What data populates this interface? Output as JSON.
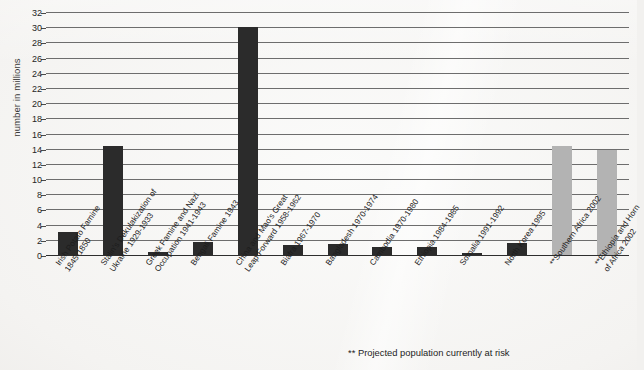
{
  "chart_data": {
    "type": "bar",
    "title": "",
    "xlabel": "",
    "ylabel": "number in millions",
    "ylim": [
      0,
      32
    ],
    "ytick_step": 2,
    "yticks": [
      0,
      2,
      4,
      6,
      8,
      10,
      12,
      14,
      16,
      18,
      20,
      22,
      24,
      26,
      28,
      30,
      32
    ],
    "grid": "horizontal",
    "legend": "none",
    "categories": [
      "Irish Potato Famine 1845-1850",
      "Stalin's Dekulakization of Ukraine 1929-1933",
      "Greek Famine and Nazi Occupation 1941-1943",
      "Bengali Famine 1943",
      "China and Mao's Great Leap Forward 1958-1962",
      "Biafra 1967-1970",
      "Bangladesh 1970-1974",
      "Cambodia 1970-1980",
      "Ethiopia 1984-1985",
      "Somalia 1991-1992",
      "North Korea 1995",
      "**Southern Africa 2002",
      "**Ethiopia and Horn of Africa 2002"
    ],
    "values": [
      3.0,
      14.3,
      0.45,
      1.7,
      30.0,
      1.3,
      1.5,
      1.0,
      1.0,
      0.3,
      1.6,
      14.3,
      13.8
    ],
    "bar_colors": [
      "#2b2b2b",
      "#2b2b2b",
      "#2b2b2b",
      "#2b2b2b",
      "#2b2b2b",
      "#2b2b2b",
      "#2b2b2b",
      "#2b2b2b",
      "#2b2b2b",
      "#2b2b2b",
      "#2b2b2b",
      "#b3b3b3",
      "#b3b3b3"
    ],
    "annotations": [
      "** Projected  population currently at risk"
    ]
  },
  "axis": {
    "y_title": "number in millions",
    "y_ticks": [
      "32",
      "30",
      "28",
      "26",
      "24",
      "22",
      "20",
      "18",
      "16",
      "14",
      "12",
      "10",
      "8",
      "6",
      "4",
      "2",
      "0"
    ]
  },
  "xlabels": [
    {
      "line1": "Irish Potato Famine",
      "line2": "1845-1850"
    },
    {
      "line1": "Stalin's Dekulakization of",
      "line2": "Ukraine 1929-1933"
    },
    {
      "line1": "Greek Famine and Nazi",
      "line2": "Occupation 1941-1943"
    },
    {
      "line1": "Bengali Famine 1943",
      "line2": ""
    },
    {
      "line1": "China and Mao's Great",
      "line2": "Leap Forward 1958-1962"
    },
    {
      "line1": "Biafra 1967-1970",
      "line2": ""
    },
    {
      "line1": "Bangladesh 1970-1974",
      "line2": ""
    },
    {
      "line1": "Cambodia 1970-1980",
      "line2": ""
    },
    {
      "line1": "Ethiopia 1984-1985",
      "line2": ""
    },
    {
      "line1": "Somalia 1991-1992",
      "line2": ""
    },
    {
      "line1": "North Korea 1995",
      "line2": ""
    },
    {
      "line1": "**Southern Africa 2002",
      "line2": ""
    },
    {
      "line1": "**Ethiopia and Horn",
      "line2": "of Africa 2002"
    }
  ],
  "footnote": "**  Projected  population currently at risk",
  "colors": {
    "bar_dark": "#2b2b2b",
    "bar_gray": "#b3b3b3",
    "background": "#f4f3f1",
    "gridline": "#6d6d6d"
  }
}
